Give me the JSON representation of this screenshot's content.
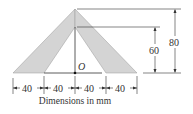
{
  "figure": {
    "label_origin": "O",
    "height_inner": "60",
    "height_outer": "80",
    "base_segments": [
      "40",
      "40",
      "40",
      "40"
    ],
    "caption": "Dimensions in mm",
    "fill_color": "#d4d4d4",
    "line_color": "#333333"
  }
}
